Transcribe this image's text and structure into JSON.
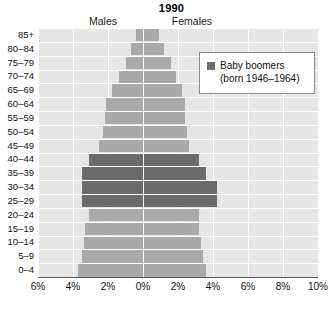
{
  "chart_data": {
    "type": "bar",
    "title": "1990",
    "subtype": "population-pyramid",
    "xlabel": "",
    "ylabel": "",
    "xlim": [
      -6,
      10
    ],
    "xticks": [
      "6%",
      "4%",
      "2%",
      "0%",
      "2%",
      "4%",
      "6%",
      "8%",
      "10%"
    ],
    "xtick_values": [
      -6,
      -4,
      -2,
      0,
      2,
      4,
      6,
      8,
      10
    ],
    "grid": true,
    "legend_position": "top-right",
    "left_side_label": "Males",
    "right_side_label": "Females",
    "categories": [
      "85+",
      "80–84",
      "75–79",
      "70–74",
      "65–69",
      "60–64",
      "55–59",
      "50–54",
      "45–49",
      "40–44",
      "35–39",
      "30–34",
      "25–29",
      "20–24",
      "15–19",
      "10–14",
      "5–9",
      "0–4"
    ],
    "series": [
      {
        "name": "Males",
        "side": "left",
        "values": [
          0.4,
          0.7,
          1.0,
          1.4,
          1.8,
          2.1,
          2.2,
          2.3,
          2.5,
          3.1,
          3.5,
          3.5,
          3.5,
          3.1,
          3.3,
          3.4,
          3.5,
          3.7
        ]
      },
      {
        "name": "Females",
        "side": "right",
        "values": [
          0.9,
          1.2,
          1.6,
          1.9,
          2.2,
          2.4,
          2.4,
          2.5,
          2.6,
          3.2,
          3.6,
          4.2,
          4.2,
          3.2,
          3.2,
          3.3,
          3.4,
          3.6
        ]
      }
    ],
    "highlight": {
      "label": "Baby boomers",
      "sublabel": "(born 1946–1964)",
      "color": "#6b6b6b",
      "categories": [
        "40–44",
        "35–39",
        "30–34",
        "25–29"
      ]
    },
    "colors": {
      "bar": "#a9a9a9",
      "highlight_bar": "#6b6b6b",
      "plot_background": "#e6e6e6",
      "gridline": "#ffffff",
      "axis": "#5a5a5a"
    }
  }
}
